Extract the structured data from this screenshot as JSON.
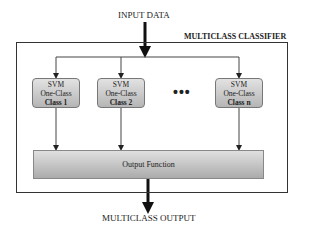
{
  "diagram": {
    "input_label": "INPUT DATA",
    "container_label": "MULTICLASS CLASSIFIER",
    "classifiers": [
      {
        "line1": "SVM",
        "line2": "One-Class",
        "line3": "Class 1"
      },
      {
        "line1": "SVM",
        "line2": "One-Class",
        "line3": "Class  2"
      },
      {
        "line1": "SVM",
        "line2": "One-Class",
        "line3": "Class n"
      }
    ],
    "ellipsis": "•••",
    "output_function_label": "Output Function",
    "output_label": "MULTICLASS OUTPUT"
  }
}
